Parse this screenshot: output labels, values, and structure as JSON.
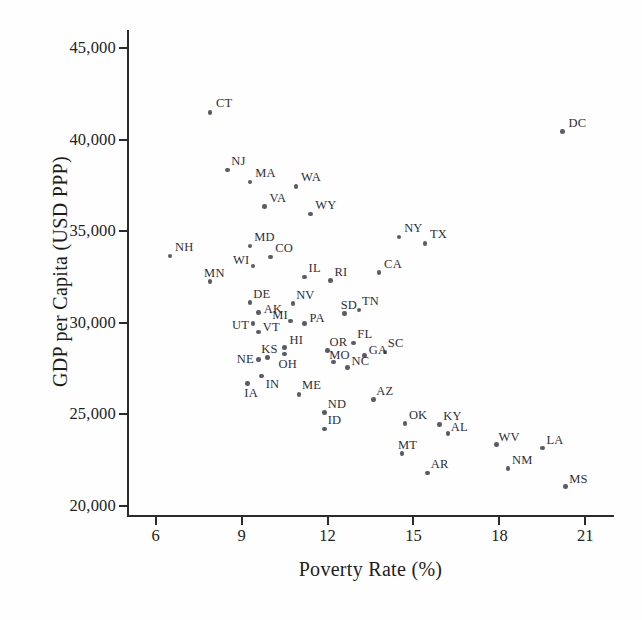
{
  "chart_data": {
    "type": "scatter",
    "title": "",
    "xlabel": "Poverty Rate (%)",
    "ylabel": "GDP per Capita (USD PPP)",
    "xlim": [
      5.0,
      22.0
    ],
    "ylim": [
      19500,
      46000
    ],
    "xticks": [
      6,
      9,
      12,
      15,
      18,
      21
    ],
    "xtick_labels": [
      "6",
      "9",
      "12",
      "15",
      "18",
      "21"
    ],
    "yticks": [
      20000,
      25000,
      30000,
      35000,
      40000,
      45000
    ],
    "ytick_labels": [
      "20,000",
      "25,000",
      "30,000",
      "35,000",
      "40,000",
      "45,000"
    ],
    "grid": false,
    "legend": false,
    "marker_color": "#5b5b66",
    "axis_color": "#2b2b2b",
    "points": [
      {
        "label": "CT",
        "x": 7.9,
        "y": 41500,
        "lx": 6,
        "ly": -15
      },
      {
        "label": "DC",
        "x": 20.2,
        "y": 40450,
        "lx": 6,
        "ly": -15
      },
      {
        "label": "NJ",
        "x": 8.5,
        "y": 38350,
        "lx": 4,
        "ly": -15
      },
      {
        "label": "MA",
        "x": 9.3,
        "y": 37700,
        "lx": 5,
        "ly": -15
      },
      {
        "label": "WA",
        "x": 10.9,
        "y": 37450,
        "lx": 5,
        "ly": -15
      },
      {
        "label": "VA",
        "x": 9.8,
        "y": 36350,
        "lx": 5,
        "ly": -15
      },
      {
        "label": "WY",
        "x": 11.4,
        "y": 35950,
        "lx": 5,
        "ly": -15
      },
      {
        "label": "NY",
        "x": 14.5,
        "y": 34700,
        "lx": 5,
        "ly": -15
      },
      {
        "label": "TX",
        "x": 15.4,
        "y": 34350,
        "lx": 5,
        "ly": -15
      },
      {
        "label": "MD",
        "x": 9.3,
        "y": 34200,
        "lx": 4,
        "ly": -15
      },
      {
        "label": "NH",
        "x": 6.5,
        "y": 33650,
        "lx": 5,
        "ly": -15
      },
      {
        "label": "CO",
        "x": 10.0,
        "y": 33600,
        "lx": 5,
        "ly": -15
      },
      {
        "label": "WI",
        "x": 9.4,
        "y": 33100,
        "lx": -20,
        "ly": -12
      },
      {
        "label": "CA",
        "x": 13.8,
        "y": 32750,
        "lx": 5,
        "ly": -15
      },
      {
        "label": "IL",
        "x": 11.2,
        "y": 32500,
        "lx": 4,
        "ly": -15
      },
      {
        "label": "RI",
        "x": 12.1,
        "y": 32300,
        "lx": 4,
        "ly": -15
      },
      {
        "label": "MN",
        "x": 7.9,
        "y": 32250,
        "lx": -6,
        "ly": -15
      },
      {
        "label": "DE",
        "x": 9.3,
        "y": 31100,
        "lx": 3,
        "ly": -15
      },
      {
        "label": "NV",
        "x": 10.8,
        "y": 31050,
        "lx": 3,
        "ly": -15
      },
      {
        "label": "TN",
        "x": 13.1,
        "y": 30700,
        "lx": 3,
        "ly": -15
      },
      {
        "label": "SD",
        "x": 12.6,
        "y": 30500,
        "lx": -4,
        "ly": -15
      },
      {
        "label": "AK",
        "x": 9.6,
        "y": 30550,
        "lx": 5,
        "ly": -10
      },
      {
        "label": "MI",
        "x": 10.7,
        "y": 30100,
        "lx": -18,
        "ly": -12
      },
      {
        "label": "PA",
        "x": 11.2,
        "y": 29950,
        "lx": 5,
        "ly": -12
      },
      {
        "label": "UT",
        "x": 9.4,
        "y": 29950,
        "lx": -21,
        "ly": -5
      },
      {
        "label": "VT",
        "x": 9.6,
        "y": 29500,
        "lx": 4,
        "ly": -11
      },
      {
        "label": "FL",
        "x": 12.9,
        "y": 28900,
        "lx": 4,
        "ly": -15
      },
      {
        "label": "HI",
        "x": 10.5,
        "y": 28650,
        "lx": 5,
        "ly": -14
      },
      {
        "label": "OR",
        "x": 12.0,
        "y": 28500,
        "lx": 2,
        "ly": -14
      },
      {
        "label": "SC",
        "x": 14.0,
        "y": 28400,
        "lx": 3,
        "ly": -15
      },
      {
        "label": "GA",
        "x": 13.3,
        "y": 28200,
        "lx": 4,
        "ly": -12
      },
      {
        "label": "OH",
        "x": 10.5,
        "y": 28300,
        "lx": -6,
        "ly": 4
      },
      {
        "label": "KS",
        "x": 9.9,
        "y": 28100,
        "lx": -6,
        "ly": -15
      },
      {
        "label": "MO",
        "x": 12.2,
        "y": 27850,
        "lx": -4,
        "ly": -13
      },
      {
        "label": "NE",
        "x": 9.6,
        "y": 28000,
        "lx": -22,
        "ly": -6
      },
      {
        "label": "NC",
        "x": 12.7,
        "y": 27550,
        "lx": 4,
        "ly": -13
      },
      {
        "label": "IN",
        "x": 9.7,
        "y": 27100,
        "lx": 4,
        "ly": 2
      },
      {
        "label": "IA",
        "x": 9.2,
        "y": 26700,
        "lx": -3,
        "ly": 4
      },
      {
        "label": "ME",
        "x": 11.0,
        "y": 26100,
        "lx": 3,
        "ly": -15
      },
      {
        "label": "AZ",
        "x": 13.6,
        "y": 25800,
        "lx": 3,
        "ly": -15
      },
      {
        "label": "ND",
        "x": 11.9,
        "y": 25100,
        "lx": 3,
        "ly": -15
      },
      {
        "label": "OK",
        "x": 14.7,
        "y": 24500,
        "lx": 4,
        "ly": -14
      },
      {
        "label": "KY",
        "x": 15.9,
        "y": 24450,
        "lx": 4,
        "ly": -14
      },
      {
        "label": "ID",
        "x": 11.9,
        "y": 24200,
        "lx": 3,
        "ly": -15
      },
      {
        "label": "AL",
        "x": 16.2,
        "y": 23950,
        "lx": 3,
        "ly": -13
      },
      {
        "label": "WV",
        "x": 17.9,
        "y": 23350,
        "lx": 2,
        "ly": -14
      },
      {
        "label": "LA",
        "x": 19.5,
        "y": 23150,
        "lx": 4,
        "ly": -14
      },
      {
        "label": "MT",
        "x": 14.6,
        "y": 22850,
        "lx": -4,
        "ly": -15
      },
      {
        "label": "NM",
        "x": 18.3,
        "y": 22050,
        "lx": 4,
        "ly": -14
      },
      {
        "label": "AR",
        "x": 15.5,
        "y": 21800,
        "lx": 3,
        "ly": -15
      },
      {
        "label": "MS",
        "x": 20.3,
        "y": 21050,
        "lx": 4,
        "ly": -14
      }
    ]
  }
}
